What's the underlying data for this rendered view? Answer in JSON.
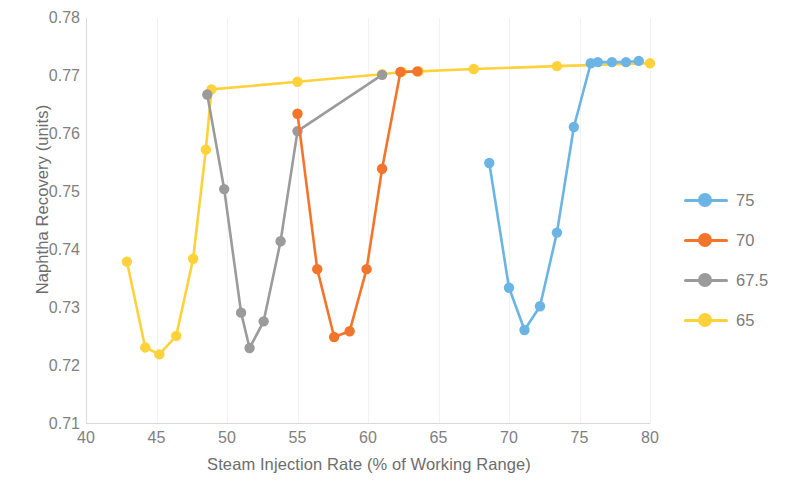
{
  "chart_data": {
    "type": "line",
    "title": "",
    "xlabel": "Steam Injection Rate (% of Working Range)",
    "ylabel": "Naphtha Recovery (units)",
    "xlim": [
      40,
      80
    ],
    "ylim": [
      0.71,
      0.78
    ],
    "xticks": [
      40,
      45,
      50,
      55,
      60,
      65,
      70,
      75,
      80
    ],
    "yticks": [
      "0.71",
      "0.72",
      "0.73",
      "0.74",
      "0.75",
      "0.76",
      "0.77",
      "0.78"
    ],
    "grid": "vertical-light",
    "legend_position": "right",
    "markers": "circle",
    "series": [
      {
        "name": "75",
        "color": "#6CB4E4",
        "x": [
          68.6,
          70.0,
          71.1,
          72.2,
          73.4,
          74.6,
          75.8,
          76.3,
          77.3,
          78.3,
          79.2
        ],
        "y": [
          0.755,
          0.7335,
          0.7262,
          0.7303,
          0.743,
          0.7612,
          0.7722,
          0.7724,
          0.7724,
          0.7724,
          0.7726
        ]
      },
      {
        "name": "70",
        "color": "#F2752B",
        "x": [
          55.0,
          56.4,
          57.6,
          58.7,
          59.9,
          61.0,
          62.3,
          63.5
        ],
        "y": [
          0.7635,
          0.7367,
          0.725,
          0.726,
          0.7367,
          0.754,
          0.7707,
          0.7708
        ]
      },
      {
        "name": "67.5",
        "color": "#9B9B9B",
        "x": [
          48.6,
          49.8,
          51.0,
          51.6,
          52.6,
          53.8,
          55.0,
          61.0
        ],
        "y": [
          0.7668,
          0.7505,
          0.7292,
          0.7231,
          0.7277,
          0.7415,
          0.7605,
          0.7702
        ]
      },
      {
        "name": "65",
        "color": "#FFD13B",
        "x": [
          42.9,
          44.2,
          45.2,
          46.4,
          47.6,
          48.5,
          48.9,
          55.0,
          61.0,
          62.4,
          63.6,
          67.5,
          73.4,
          80.0
        ],
        "y": [
          0.738,
          0.7232,
          0.722,
          0.7252,
          0.7385,
          0.7573,
          0.7677,
          0.769,
          0.7703,
          0.7707,
          0.7708,
          0.7712,
          0.7717,
          0.7722
        ]
      }
    ]
  },
  "legend": {
    "items": [
      {
        "label": "75",
        "color": "#6CB4E4"
      },
      {
        "label": "70",
        "color": "#F2752B"
      },
      {
        "label": "67.5",
        "color": "#9B9B9B"
      },
      {
        "label": "65",
        "color": "#FFD13B"
      }
    ]
  }
}
